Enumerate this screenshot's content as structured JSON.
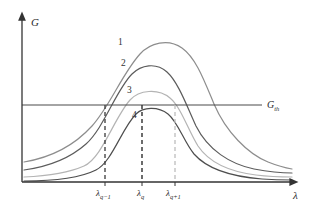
{
  "figure": {
    "type": "line-diagram",
    "background": "#ffffff",
    "axes": {
      "y_label": "G",
      "x_label": "λ",
      "axis_color": "#333333",
      "origin_px": [
        22,
        182
      ],
      "x_end_px": 296,
      "y_top_px": 14
    },
    "threshold": {
      "label": "G",
      "label_sub": "th",
      "y_px": 105,
      "color": "#4a4a4a",
      "x_start_px": 22,
      "x_end_px": 262
    },
    "curves": [
      {
        "name": "1",
        "label": "1",
        "color": "#8d8d8d",
        "width": 1.2,
        "peak_px": [
          160,
          42
        ],
        "label_px": [
          118,
          41
        ],
        "left_tail_y_px": 162,
        "right_tail_y_px": 168,
        "peak_value_rel": 1.0,
        "above_threshold": true
      },
      {
        "name": "2",
        "label": "2",
        "color": "#5c5c5c",
        "width": 1.2,
        "peak_px": [
          147,
          63
        ],
        "label_px": [
          121,
          63
        ],
        "left_tail_y_px": 170,
        "right_tail_y_px": 172,
        "peak_value_rel": 0.85,
        "above_threshold": true
      },
      {
        "name": "3",
        "label": "3",
        "color": "#b4b4b4",
        "width": 1.2,
        "peak_px": [
          150,
          90
        ],
        "label_px": [
          127,
          90
        ],
        "left_tail_y_px": 176,
        "right_tail_y_px": 175,
        "peak_value_rel": 0.66,
        "above_threshold": true
      },
      {
        "name": "4",
        "label": "4",
        "color": "#4e4e4e",
        "width": 1.2,
        "peak_px": [
          150,
          106
        ],
        "label_px": [
          132,
          115
        ],
        "left_tail_y_px": 181,
        "right_tail_y_px": 178,
        "peak_value_rel": 0.54,
        "above_threshold": false
      }
    ],
    "markers": [
      {
        "name": "lambda-q-minus-1",
        "label": "λ",
        "sub": "q−1",
        "x_px": 105,
        "color": "#3a3a3a",
        "dash": "4,3",
        "y_top_px": 105,
        "y_bottom_px": 182,
        "tick": true
      },
      {
        "name": "lambda-q",
        "label": "λ",
        "sub": "q",
        "x_px": 142,
        "color": "#2e2e2e",
        "dash": "4,3",
        "y_top_px": 105,
        "y_bottom_px": 182,
        "tick": true
      },
      {
        "name": "lambda-q-plus-1",
        "label": "λ",
        "sub": "q+1",
        "x_px": 175,
        "color": "#bdbdbd",
        "dash": "4,3",
        "y_top_px": 105,
        "y_bottom_px": 182,
        "tick": true
      }
    ],
    "caption": ""
  }
}
